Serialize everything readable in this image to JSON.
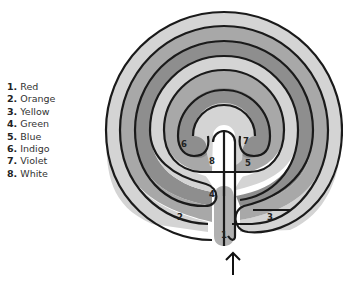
{
  "legend": {
    "items": [
      {
        "num": "1.",
        "label": "Red"
      },
      {
        "num": "2.",
        "label": "Orange"
      },
      {
        "num": "3.",
        "label": "Yellow"
      },
      {
        "num": "4.",
        "label": "Green"
      },
      {
        "num": "5.",
        "label": "Blue"
      },
      {
        "num": "6.",
        "label": "Indigo"
      },
      {
        "num": "7.",
        "label": "Violet"
      },
      {
        "num": "8.",
        "label": "White"
      }
    ]
  },
  "diagram": {
    "type": "seven-circuit classical labyrinth",
    "entrance_arrow": "up-arrow",
    "circuit_labels": [
      "1",
      "2",
      "3",
      "4",
      "5",
      "6",
      "7",
      "8"
    ],
    "colors": {
      "light": "#d4d4d4",
      "medium": "#a8a8a8",
      "dark": "#8e8e8e",
      "center": "#ffffff",
      "wall": "#1a1a1a"
    }
  }
}
